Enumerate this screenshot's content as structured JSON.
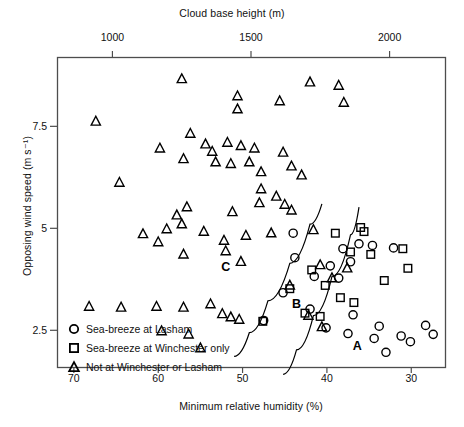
{
  "chart_data": {
    "type": "scatter",
    "title": "",
    "top_axis": {
      "label": "Cloud base height (m)",
      "ticks": [
        1000,
        1500,
        2000
      ],
      "tick_labels": [
        "1000",
        "1500",
        "2000"
      ],
      "range": [
        800,
        2200
      ]
    },
    "xlabel": "Minimum relative humidity (%)",
    "ylabel": "Opposing wind speed (m s⁻¹)",
    "xticks": [
      70,
      60,
      50,
      40,
      30
    ],
    "xtick_labels": [
      "70",
      "60",
      "50",
      "40",
      "30"
    ],
    "yticks": [
      2.5,
      5,
      7.5
    ],
    "ytick_labels": [
      "2.5",
      "5",
      "7.5"
    ],
    "xlim": [
      72,
      26
    ],
    "ylim": [
      1.6,
      9.2
    ],
    "x_axis_reversed": true,
    "grid": false,
    "legend_position": "inside-bottom-left",
    "series": [
      {
        "name": "Sea-breeze at Lasham",
        "marker": "circle",
        "points": [
          [
            43.8,
            4.28
          ],
          [
            41.5,
            3.82
          ],
          [
            39.6,
            4.08
          ],
          [
            38.1,
            4.5
          ],
          [
            37.2,
            4.18
          ],
          [
            38.6,
            3.78
          ],
          [
            36.2,
            4.62
          ],
          [
            34.6,
            4.58
          ],
          [
            32.1,
            4.52
          ],
          [
            45.2,
            3.42
          ],
          [
            42.0,
            3.02
          ],
          [
            36.9,
            2.88
          ],
          [
            40.1,
            2.56
          ],
          [
            37.5,
            2.42
          ],
          [
            33.8,
            2.6
          ],
          [
            34.4,
            2.3
          ],
          [
            31.2,
            2.36
          ],
          [
            30.1,
            2.22
          ],
          [
            28.3,
            2.62
          ],
          [
            27.4,
            2.4
          ],
          [
            47.5,
            2.74
          ],
          [
            33.0,
            1.96
          ],
          [
            44.0,
            4.88
          ]
        ]
      },
      {
        "name": "Sea-breeze at Winchester only",
        "marker": "square",
        "points": [
          [
            39.0,
            4.88
          ],
          [
            37.2,
            4.42
          ],
          [
            35.6,
            4.92
          ],
          [
            34.8,
            4.36
          ],
          [
            41.8,
            3.98
          ],
          [
            40.2,
            3.6
          ],
          [
            38.4,
            3.3
          ],
          [
            36.8,
            3.18
          ],
          [
            42.6,
            2.92
          ],
          [
            40.8,
            2.84
          ],
          [
            33.2,
            3.72
          ],
          [
            31.0,
            4.5
          ],
          [
            30.4,
            4.02
          ],
          [
            44.4,
            3.52
          ],
          [
            47.6,
            2.72
          ],
          [
            36.0,
            5.02
          ]
        ]
      },
      {
        "name": "Not at Winchester or Lasham",
        "marker": "triangle",
        "points": [
          [
            67.4,
            7.62
          ],
          [
            57.2,
            8.66
          ],
          [
            50.6,
            8.24
          ],
          [
            50.6,
            7.92
          ],
          [
            45.6,
            8.12
          ],
          [
            42.0,
            8.58
          ],
          [
            38.6,
            8.5
          ],
          [
            38.0,
            8.08
          ],
          [
            56.2,
            7.32
          ],
          [
            54.4,
            7.06
          ],
          [
            53.6,
            6.88
          ],
          [
            51.8,
            7.1
          ],
          [
            50.2,
            7.02
          ],
          [
            48.6,
            6.96
          ],
          [
            53.2,
            6.62
          ],
          [
            51.4,
            6.58
          ],
          [
            49.2,
            6.62
          ],
          [
            47.8,
            6.38
          ],
          [
            45.2,
            6.86
          ],
          [
            44.2,
            6.52
          ],
          [
            43.0,
            6.3
          ],
          [
            59.8,
            6.96
          ],
          [
            57.0,
            6.7
          ],
          [
            64.6,
            6.12
          ],
          [
            47.8,
            5.96
          ],
          [
            46.0,
            5.78
          ],
          [
            45.0,
            5.58
          ],
          [
            48.0,
            5.62
          ],
          [
            56.6,
            5.52
          ],
          [
            57.8,
            5.32
          ],
          [
            51.2,
            5.4
          ],
          [
            44.2,
            5.44
          ],
          [
            57.2,
            5.1
          ],
          [
            61.8,
            4.86
          ],
          [
            60.0,
            4.66
          ],
          [
            59.0,
            4.98
          ],
          [
            54.6,
            4.92
          ],
          [
            52.2,
            4.7
          ],
          [
            49.6,
            4.82
          ],
          [
            46.6,
            4.88
          ],
          [
            41.6,
            4.96
          ],
          [
            57.0,
            4.36
          ],
          [
            52.0,
            4.44
          ],
          [
            50.2,
            4.18
          ],
          [
            40.8,
            4.1
          ],
          [
            39.4,
            3.78
          ],
          [
            68.2,
            3.08
          ],
          [
            64.4,
            3.06
          ],
          [
            60.2,
            3.08
          ],
          [
            57.0,
            3.06
          ],
          [
            53.8,
            3.14
          ],
          [
            52.4,
            2.9
          ],
          [
            51.4,
            2.82
          ],
          [
            50.4,
            2.76
          ],
          [
            59.6,
            2.48
          ],
          [
            56.4,
            2.4
          ],
          [
            55.0,
            2.06
          ],
          [
            42.2,
            2.86
          ],
          [
            40.6,
            2.58
          ],
          [
            44.4,
            3.6
          ],
          [
            37.6,
            4.02
          ]
        ]
      }
    ],
    "region_labels": [
      {
        "text": "C",
        "x": 52.0,
        "y": 4.06
      },
      {
        "text": "B",
        "x": 43.6,
        "y": 3.14
      },
      {
        "text": "A",
        "x": 36.4,
        "y": 2.12
      }
    ],
    "divider_curves": [
      {
        "name": "curve-c-b",
        "points": [
          [
            51.0,
            1.86
          ],
          [
            49.2,
            2.44
          ],
          [
            47.0,
            3.22
          ],
          [
            44.4,
            4.14
          ],
          [
            42.0,
            5.1
          ],
          [
            40.6,
            5.6
          ]
        ]
      },
      {
        "name": "curve-b-a",
        "points": [
          [
            45.2,
            1.42
          ],
          [
            43.6,
            2.02
          ],
          [
            41.6,
            2.86
          ],
          [
            39.4,
            3.82
          ],
          [
            37.2,
            4.84
          ],
          [
            36.2,
            5.52
          ]
        ]
      }
    ]
  },
  "legend": {
    "items": [
      {
        "label": "Sea-breeze at Lasham",
        "marker": "circle"
      },
      {
        "label": "Sea-breeze at Winchester only",
        "marker": "square"
      },
      {
        "label": "Not at Winchester or Lasham",
        "marker": "triangle"
      }
    ]
  },
  "colors": {
    "axis": "#4d4d4d",
    "marker": "#000000",
    "text": "#111111",
    "background": "#ffffff"
  }
}
